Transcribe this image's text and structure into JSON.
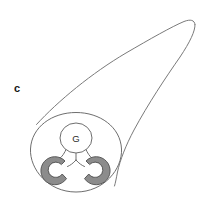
{
  "figure": {
    "panel_label": "c",
    "background_color": "#ffffff",
    "width": 204,
    "height": 199
  },
  "labels": {
    "panel": "c",
    "gland_lumen": "G"
  },
  "colors": {
    "outline_stroke": "#6e6e6e",
    "tube_stroke": "#7a7a7a",
    "ring_fill": "#8c8c8c",
    "ring_stroke": "#5a5a5a",
    "lumen_fill": "#ffffff",
    "label_text": "#161616",
    "structure_text": "#2b2b2b"
  },
  "geometry": {
    "cross_section": {
      "center_x": 76,
      "center_y": 152,
      "radius_x": 46,
      "radius_y": 40
    },
    "gland_circle": {
      "center_x": 76,
      "center_y": 138,
      "radius_x": 16,
      "radius_y": 15
    },
    "left_ring": {
      "center_x": 58,
      "center_y": 170,
      "outer_radius": 14,
      "inner_radius": 7.5,
      "gap_direction": "upper-right"
    },
    "right_ring": {
      "center_x": 93,
      "center_y": 170,
      "outer_radius": 14,
      "inner_radius": 7.5,
      "gap_direction": "upper-left"
    },
    "tube_tip": {
      "x": 193,
      "y": 24
    }
  }
}
